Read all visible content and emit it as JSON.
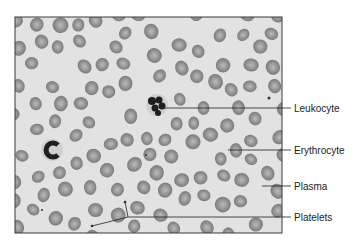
{
  "figure": {
    "type": "labeled-micrograph",
    "colors": {
      "background": "#ffffff",
      "plasma": "#e2e2e2",
      "frame": "#3a3a3a",
      "erythrocyte": "#8c8c8c",
      "erythrocyte_center": "#b4b4b4",
      "nucleus": "#1e1e1e",
      "leader_line": "#222222"
    },
    "labels": [
      {
        "id": "leukocyte",
        "text": "Leukocyte",
        "y": 108,
        "from_x": 165
      },
      {
        "id": "erythrocyte",
        "text": "Erythrocyte",
        "y": 150,
        "from_x": 228
      },
      {
        "id": "plasma",
        "text": "Plasma",
        "y": 186,
        "from_x": 262
      },
      {
        "id": "platelets",
        "text": "Platelets",
        "y": 217,
        "from_x": 128
      }
    ]
  }
}
